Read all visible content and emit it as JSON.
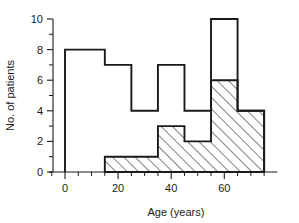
{
  "chart_data": {
    "type": "bar",
    "title": "",
    "subtitle": "",
    "xlabel": "Age (years)",
    "ylabel": "No. of patients",
    "xlim": [
      -6,
      80
    ],
    "ylim": [
      0,
      10
    ],
    "grid": false,
    "legend": "none",
    "x_tick_labels": [
      "0",
      "20",
      "40",
      "60"
    ],
    "x_tick_values": [
      0,
      20,
      40,
      60
    ],
    "x_minor_tick_values": [
      -5,
      5,
      10,
      15,
      25,
      30,
      35,
      45,
      50,
      55,
      65,
      70,
      75
    ],
    "y_tick_labels": [
      "0",
      "2",
      "4",
      "6",
      "8",
      "10"
    ],
    "y_tick_values": [
      0,
      2,
      4,
      6,
      8,
      10
    ],
    "y_minor_tick_values": [
      1,
      3,
      5,
      7,
      9
    ],
    "bin_edges": [
      0,
      15,
      25,
      35,
      45,
      55,
      65,
      75
    ],
    "series": [
      {
        "name": "All patients",
        "style": "open-outline",
        "values": [
          8,
          7,
          4,
          7,
          4,
          10,
          4
        ]
      },
      {
        "name": "Hatched subgroup",
        "style": "diagonal-hatch",
        "values": [
          0,
          1,
          1,
          3,
          2,
          6,
          4
        ]
      }
    ],
    "hatch_bin_edges": [
      15,
      35,
      45,
      55,
      65,
      75
    ],
    "hatch_values": [
      1,
      3,
      2,
      6,
      4
    ]
  },
  "axes": {
    "x_title": "Age (years)",
    "y_title": "No. of patients"
  }
}
